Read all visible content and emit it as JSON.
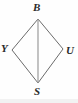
{
  "figure": {
    "type": "geometry-diagram",
    "shape_name": "rhombus",
    "canvas": {
      "width": 78,
      "height": 103
    },
    "background_color": "#fefefe",
    "stroke_color": "#6b6b6b",
    "stroke_width": 1,
    "label_color": "#2b2b2b",
    "vertices": [
      {
        "id": "B",
        "label": "B",
        "x": 38,
        "y": 19,
        "label_x": 33,
        "label_y": 2,
        "position": "top"
      },
      {
        "id": "Y",
        "label": "Y",
        "x": 12,
        "y": 50,
        "label_x": 1,
        "label_y": 43,
        "position": "left"
      },
      {
        "id": "U",
        "label": "U",
        "x": 63,
        "y": 49,
        "label_x": 66,
        "label_y": 45,
        "position": "right"
      },
      {
        "id": "S",
        "label": "S",
        "x": 38,
        "y": 83,
        "label_x": 34,
        "label_y": 86,
        "position": "bottom"
      }
    ],
    "edges": [
      {
        "id": "BY",
        "from": "B",
        "to": "Y",
        "kind": "side"
      },
      {
        "id": "BU",
        "from": "B",
        "to": "U",
        "kind": "side"
      },
      {
        "id": "YS",
        "from": "Y",
        "to": "S",
        "kind": "side"
      },
      {
        "id": "US",
        "from": "U",
        "to": "S",
        "kind": "side"
      }
    ],
    "diagonals": [
      {
        "id": "BS",
        "from": "B",
        "to": "S",
        "kind": "diagonal"
      }
    ]
  }
}
